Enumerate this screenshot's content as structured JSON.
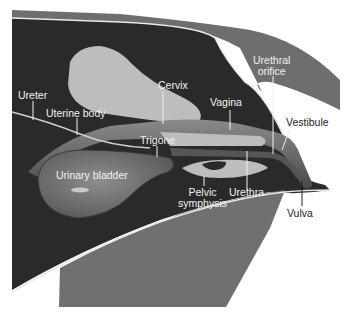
{
  "diagram": {
    "colors": {
      "background": "#ffffff",
      "body_dark": "#2a2a2a",
      "skin_band": "#6e6e6e",
      "bone_light": "#bdbdbd",
      "thigh": "#707070",
      "bladder": "#7a7a7a",
      "outline": "#e8e8e8",
      "leader_line_light": "#f0f0f0",
      "leader_line_dark": "#222222"
    },
    "labels": {
      "ureter": "Ureter",
      "uterine_body": "Uterine body",
      "cervix": "Cervix",
      "vagina": "Vagina",
      "urethral_orifice_line1": "Urethral",
      "urethral_orifice_line2": "orifice",
      "vestibule": "Vestibule",
      "trigone": "Trigone",
      "urinary_bladder": "Urinary bladder",
      "pelvic_symphysis_line1": "Pelvic",
      "pelvic_symphysis_line2": "symphysis",
      "urethra": "Urethra",
      "vulva": "Vulva"
    }
  }
}
